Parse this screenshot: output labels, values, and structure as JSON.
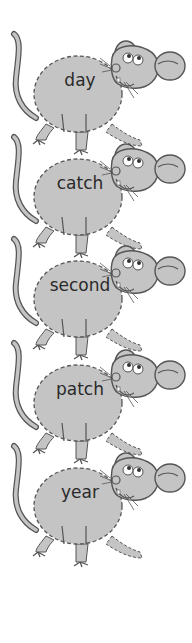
{
  "worksheet": {
    "colors": {
      "fill": "#c4c4c4",
      "outline": "#555555",
      "text": "#2a2a2a",
      "background": "#ffffff"
    },
    "mice": [
      {
        "word": "day",
        "top": 28
      },
      {
        "word": "catch",
        "top": 131
      },
      {
        "word": "second",
        "top": 233
      },
      {
        "word": "patch",
        "top": 337
      },
      {
        "word": "year",
        "top": 440
      }
    ]
  }
}
